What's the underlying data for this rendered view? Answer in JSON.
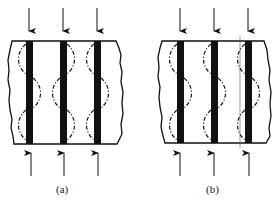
{
  "figure": {
    "panels": [
      {
        "id": "a",
        "label": "(a)",
        "arc_pattern": "alternating"
      },
      {
        "id": "b",
        "label": "(b)",
        "arc_pattern": "aligned"
      }
    ],
    "colors": {
      "ink": "#111111",
      "background": "#ffffff"
    }
  }
}
